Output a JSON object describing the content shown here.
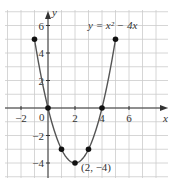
{
  "chart_data": {
    "type": "line",
    "title": "",
    "equation_label": "y = x² − 4x",
    "xlabel": "x",
    "ylabel": "y",
    "xlim": [
      -3,
      8
    ],
    "ylim": [
      -5,
      7
    ],
    "grid": true,
    "x_ticks": [
      -2,
      2,
      4,
      6
    ],
    "x_tick_labels": [
      "−2",
      "2",
      "4",
      "6"
    ],
    "y_ticks": [
      6,
      4,
      2,
      -2,
      -4
    ],
    "y_tick_labels": [
      "6",
      "4",
      "2",
      "−2",
      "−4"
    ],
    "origin_label": "0",
    "series": [
      {
        "name": "y = x^2 - 4x",
        "domain": [
          -1,
          5
        ],
        "points": [
          {
            "x": -1,
            "y": 5
          },
          {
            "x": 0,
            "y": 0
          },
          {
            "x": 1,
            "y": -3
          },
          {
            "x": 2,
            "y": -4
          },
          {
            "x": 3,
            "y": -3
          },
          {
            "x": 4,
            "y": 0
          },
          {
            "x": 5,
            "y": 5
          }
        ]
      }
    ],
    "annotations": [
      {
        "text": "(2, −4)",
        "x": 2,
        "y": -4
      }
    ],
    "colors": {
      "curve": "#555555",
      "grid": "#cccccc",
      "axis": "#333333",
      "point": "#111111"
    }
  }
}
